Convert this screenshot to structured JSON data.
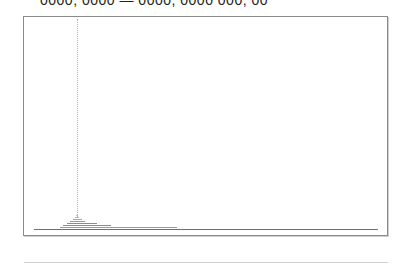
{
  "header": {
    "clipped_text": "0000, 0000 — 0000, 0000 000, 00"
  },
  "colors": {
    "panel_border": "#8a8a8a",
    "baseline": "#6f6f6f",
    "marker": "#b8b8b8",
    "bar": "#8c8c8c",
    "footer_rule": "#cfcfcf"
  },
  "chart_data": {
    "type": "bar",
    "orientation": "horizontal-stacked-profile",
    "title": "",
    "xlabel": "",
    "ylabel": "",
    "grid": false,
    "legend": null,
    "marker_x_fraction": 0.145,
    "baseline": {
      "x_start_fraction": 0.027,
      "x_end_fraction": 0.976
    },
    "levels": [
      {
        "level": 1,
        "x_start_fraction": 0.099,
        "x_end_fraction": 0.42,
        "shade": "#9a9a9a"
      },
      {
        "level": 2,
        "x_start_fraction": 0.107,
        "x_end_fraction": 0.24,
        "shade": "#8c8c8c"
      },
      {
        "level": 3,
        "x_start_fraction": 0.118,
        "x_end_fraction": 0.2,
        "shade": "#8c8c8c"
      },
      {
        "level": 4,
        "x_start_fraction": 0.128,
        "x_end_fraction": 0.17,
        "shade": "#9a9a9a"
      },
      {
        "level": 5,
        "x_start_fraction": 0.135,
        "x_end_fraction": 0.16,
        "shade": "#a8a8a8"
      },
      {
        "level": 6,
        "x_start_fraction": 0.14,
        "x_end_fraction": 0.152,
        "shade": "#b4b4b4"
      },
      {
        "level": 7,
        "x_start_fraction": 0.143,
        "x_end_fraction": 0.148,
        "shade": "#c0c0c0"
      }
    ]
  }
}
